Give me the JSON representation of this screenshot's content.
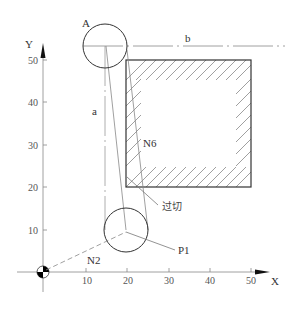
{
  "diagram": {
    "axes": {
      "x_label": "X",
      "y_label": "Y",
      "x_ticks": [
        "10",
        "20",
        "30",
        "40",
        "50"
      ],
      "y_ticks": [
        "10",
        "20",
        "30",
        "40",
        "50"
      ]
    },
    "labels": {
      "point_a": "A",
      "line_b": "b",
      "line_a": "a",
      "block_n6": "N6",
      "overcut": "过切",
      "point_p1": "P1",
      "block_n2": "N2"
    },
    "workpiece": {
      "x_min": 20,
      "x_max": 50,
      "y_min": 20,
      "y_max": 50
    },
    "tool_circles": [
      {
        "name": "A",
        "center": [
          15,
          53.5
        ],
        "note": "tool at top"
      },
      {
        "name": "P1-tool",
        "center": [
          20,
          10
        ],
        "note": "tool at bottom"
      }
    ],
    "colors": {
      "stroke": "#333333",
      "light_stroke": "#888888",
      "hatch": "#666666",
      "origin_fill": "#000000"
    }
  }
}
